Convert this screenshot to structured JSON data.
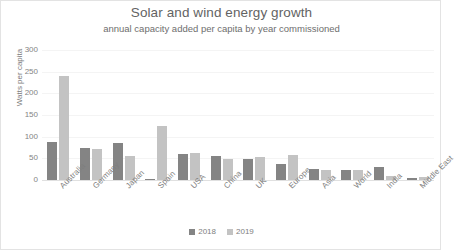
{
  "chart_data": {
    "type": "bar",
    "title": "Solar and wind energy growth",
    "subtitle": "annual capacity added per capita by year commissioned",
    "xlabel": "",
    "ylabel": "Watts per capita",
    "ylim": [
      0,
      300
    ],
    "yticks": [
      300,
      250,
      200,
      150,
      100,
      50,
      0
    ],
    "grid": true,
    "legend_position": "bottom",
    "categories": [
      "Australia",
      "Germany",
      "Japan",
      "Spain",
      "USA",
      "China",
      "UK",
      "Europe",
      "Asia",
      "World",
      "India",
      "Middle East"
    ],
    "series": [
      {
        "name": "2018",
        "color": "#848484",
        "values": [
          88,
          75,
          85,
          3,
          60,
          55,
          48,
          38,
          26,
          24,
          30,
          4
        ]
      },
      {
        "name": "2019",
        "color": "#c3c3c3",
        "values": [
          240,
          72,
          55,
          125,
          62,
          48,
          52,
          58,
          24,
          22,
          10,
          6
        ]
      }
    ]
  }
}
